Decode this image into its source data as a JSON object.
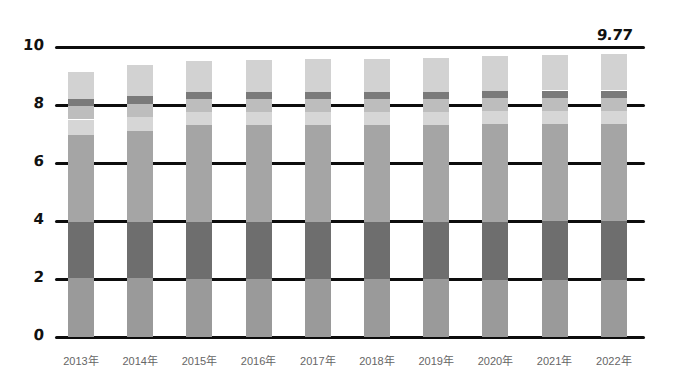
{
  "chart_data": {
    "type": "bar",
    "stacked": true,
    "title": "",
    "subtitle": "",
    "xlabel": "",
    "ylabel": "",
    "ylim": [
      0,
      10
    ],
    "ytick_labels": [
      "10",
      "8",
      "6",
      "4",
      "2",
      "0"
    ],
    "ytick_values": [
      10,
      8,
      6,
      4,
      2,
      0
    ],
    "grid": true,
    "legend": "none",
    "categories": [
      "2013年",
      "2014年",
      "2015年",
      "2016年",
      "2017年",
      "2018年",
      "2019年",
      "2020年",
      "2021年",
      "2022年"
    ],
    "totals": [
      9.15,
      9.38,
      9.52,
      9.55,
      9.6,
      9.58,
      9.63,
      9.68,
      9.72,
      9.77
    ],
    "series": [
      {
        "name": "segment-1",
        "color": "#9a9a9a",
        "values": [
          2.05,
          2.05,
          2.0,
          2.0,
          2.0,
          2.0,
          2.0,
          1.98,
          1.98,
          1.98
        ]
      },
      {
        "name": "segment-2",
        "color": "#6e6e6e",
        "values": [
          1.9,
          1.9,
          1.95,
          1.95,
          1.95,
          1.95,
          1.95,
          2.0,
          2.02,
          2.02
        ]
      },
      {
        "name": "segment-3",
        "color": "#a5a5a5",
        "values": [
          3.0,
          3.15,
          3.35,
          3.35,
          3.35,
          3.35,
          3.35,
          3.35,
          3.35,
          3.35
        ]
      },
      {
        "name": "segment-4",
        "color": "#d6d6d6",
        "values": [
          0.55,
          0.5,
          0.45,
          0.45,
          0.45,
          0.45,
          0.45,
          0.45,
          0.45,
          0.45
        ]
      },
      {
        "name": "segment-5",
        "color": "#bdbdbd",
        "values": [
          0.45,
          0.45,
          0.45,
          0.45,
          0.45,
          0.45,
          0.45,
          0.45,
          0.45,
          0.45
        ]
      },
      {
        "name": "segment-6",
        "color": "#7a7a7a",
        "values": [
          0.25,
          0.25,
          0.25,
          0.25,
          0.25,
          0.25,
          0.25,
          0.25,
          0.25,
          0.25
        ]
      },
      {
        "name": "segment-7",
        "color": "#d2d2d2",
        "values": [
          0.95,
          1.08,
          1.07,
          1.1,
          1.15,
          1.13,
          1.18,
          1.2,
          1.22,
          1.27
        ]
      }
    ],
    "annotations": [
      {
        "text": "9.77",
        "x_category": "2022年",
        "value": 9.77
      }
    ]
  }
}
